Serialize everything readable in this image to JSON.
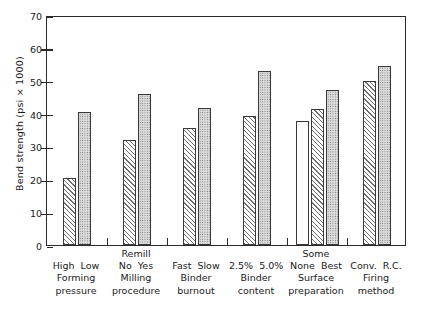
{
  "chart_data": {
    "type": "bar",
    "title": "",
    "xlabel": "",
    "ylabel": "Bend strength (psi × 1000)",
    "ylim": [
      0,
      70
    ],
    "yticks": [
      0,
      10,
      20,
      30,
      40,
      50,
      60,
      70
    ],
    "ytick_labels": [
      "0",
      "10",
      "20",
      "30",
      "40",
      "50",
      "60",
      "70"
    ],
    "grid": false,
    "legend": "none",
    "groups": [
      {
        "factor_line1": "Forming",
        "factor_line2": "pressure",
        "above_label": "",
        "levels": [
          "High",
          "Low"
        ],
        "values": [
          20.3,
          40.5
        ],
        "fills": [
          "hatch",
          "dots"
        ]
      },
      {
        "factor_line1": "Milling",
        "factor_line2": "procedure",
        "above_label": "Remill",
        "levels": [
          "No",
          "Yes"
        ],
        "values": [
          32.0,
          46.0
        ],
        "fills": [
          "hatch",
          "dots"
        ]
      },
      {
        "factor_line1": "Binder",
        "factor_line2": "burnout",
        "above_label": "",
        "levels": [
          "Fast",
          "Slow"
        ],
        "values": [
          35.5,
          41.8
        ],
        "fills": [
          "hatch",
          "dots"
        ]
      },
      {
        "factor_line1": "Binder",
        "factor_line2": "content",
        "above_label": "",
        "levels": [
          "2.5%",
          "5.0%"
        ],
        "values": [
          39.2,
          53.0
        ],
        "fills": [
          "hatch",
          "dots"
        ]
      },
      {
        "factor_line1": "Surface",
        "factor_line2": "preparation",
        "above_label": "Some",
        "levels": [
          "None",
          "Best"
        ],
        "values": [
          37.6,
          41.5,
          47.3
        ],
        "fills": [
          "none",
          "hatch",
          "dots"
        ]
      },
      {
        "factor_line1": "Firing",
        "factor_line2": "method",
        "above_label": "",
        "levels": [
          "Conv.",
          "R.C."
        ],
        "values": [
          49.8,
          54.6
        ],
        "fills": [
          "hatch",
          "dots"
        ]
      }
    ]
  }
}
